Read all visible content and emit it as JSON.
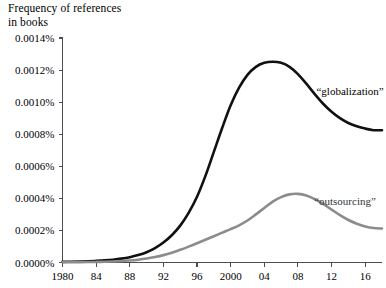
{
  "chart_data": {
    "type": "line",
    "title": "Frequency of references\nin books",
    "xlabel": "",
    "ylabel": "Frequency of references in books",
    "xlim": [
      1980,
      2018
    ],
    "ylim": [
      0.0,
      0.0014
    ],
    "grid": false,
    "legend_position": "inline-right",
    "x_tick_values": [
      1980,
      1984,
      1988,
      1992,
      1996,
      2000,
      2004,
      2008,
      2012,
      2016
    ],
    "x_tick_labels": [
      "1980",
      "84",
      "88",
      "92",
      "96",
      "2000",
      "04",
      "08",
      "12",
      "16"
    ],
    "y_tick_values": [
      0.0,
      0.0002,
      0.0004,
      0.0006,
      0.0008,
      0.001,
      0.0012,
      0.0014
    ],
    "y_tick_labels": [
      "0.0000%",
      "0.0002%",
      "0.0004%",
      "0.0006%",
      "0.0008%",
      "0.0010%",
      "0.0012%",
      "0.0014%"
    ],
    "x": [
      1980,
      1981,
      1982,
      1983,
      1984,
      1985,
      1986,
      1987,
      1988,
      1989,
      1990,
      1991,
      1992,
      1993,
      1994,
      1995,
      1996,
      1997,
      1998,
      1999,
      2000,
      2001,
      2002,
      2003,
      2004,
      2005,
      2006,
      2007,
      2008,
      2009,
      2010,
      2011,
      2012,
      2013,
      2014,
      2015,
      2016,
      2017,
      2018
    ],
    "series": [
      {
        "name": "globalization",
        "label": "“globalization”",
        "color": "#111111",
        "width": 2.6,
        "label_x": 2014.2,
        "label_y": 0.001045,
        "values": [
          4e-06,
          5e-06,
          6.2e-06,
          7.8e-06,
          1e-05,
          1.3e-05,
          1.75e-05,
          2.4e-05,
          3.3e-05,
          4.6e-05,
          6.4e-05,
          9e-05,
          0.000125,
          0.00017,
          0.00023,
          0.00031,
          0.00041,
          0.00054,
          0.00069,
          0.00084,
          0.00098,
          0.00109,
          0.00117,
          0.00122,
          0.001245,
          0.001252,
          0.001245,
          0.00122,
          0.001175,
          0.001115,
          0.00105,
          0.00099,
          0.00094,
          0.0009,
          0.00087,
          0.00085,
          0.000835,
          0.000825,
          0.000825
        ]
      },
      {
        "name": "outsourcing",
        "label": "“outsourcing”",
        "color": "#8c8c8c",
        "width": 2.6,
        "label_x": 2013.6,
        "label_y": 0.000358,
        "values": [
          1.5e-06,
          1.8e-06,
          2.2e-06,
          2.8e-06,
          3.6e-06,
          4.8e-06,
          6.5e-06,
          9e-06,
          1.25e-05,
          1.75e-05,
          2.45e-05,
          3.4e-05,
          4.6e-05,
          6.1e-05,
          7.9e-05,
          9.9e-05,
          0.00012,
          0.000142,
          0.000164,
          0.000186,
          0.000208,
          0.000232,
          0.000262,
          0.0003,
          0.00034,
          0.00038,
          0.000408,
          0.000425,
          0.000428,
          0.000418,
          0.000395,
          0.000365,
          0.00033,
          0.000295,
          0.000265,
          0.000242,
          0.000225,
          0.000215,
          0.000212
        ]
      }
    ]
  }
}
